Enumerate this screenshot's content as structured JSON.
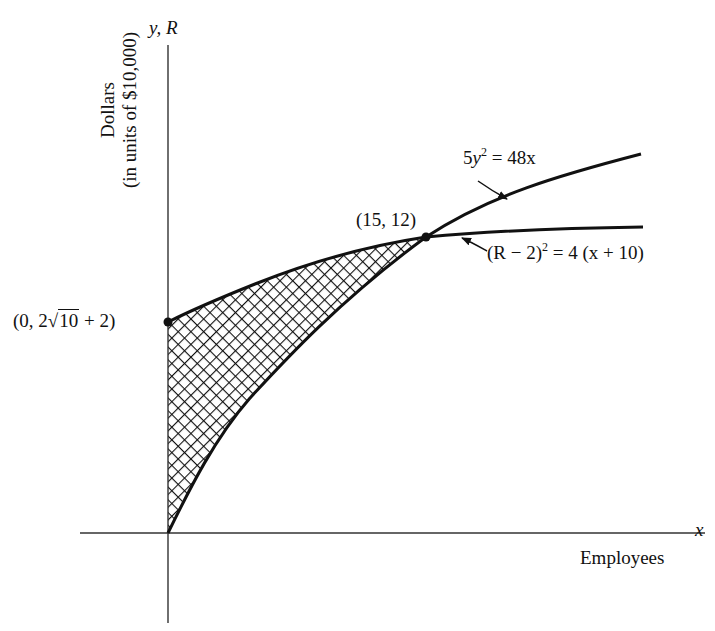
{
  "diagram": {
    "axes": {
      "x_axis_label": "x",
      "y_axis_label": "y, R",
      "x_axis_title": "Employees",
      "y_axis_title_line1": "Dollars",
      "y_axis_title_line2": "(in units of $10,000)"
    },
    "curves": [
      {
        "name": "cost-curve",
        "equation_lhs_coef": "5",
        "equation_lhs_var": "y",
        "equation_lhs_exp": "2",
        "equation_rhs": "= 48x",
        "full_label": "5y^2 = 48x"
      },
      {
        "name": "revenue-curve",
        "equation_lhs": "(R − 2)",
        "equation_lhs_exp": "2",
        "equation_rhs": "= 4 (x + 10)",
        "full_label": "(R - 2)^2 = 4 (x + 10)"
      }
    ],
    "points": [
      {
        "label": "(15, 12)",
        "x": 15,
        "y": 12
      },
      {
        "label_prefix": "(0, 2",
        "label_radicand": "10",
        "label_suffix": " + 2)",
        "full_label": "(0, 2√10 + 2)",
        "x": 0,
        "y": "2√10 + 2"
      }
    ],
    "shaded_region": "area between (R-2)^2 = 4(x+10) above and 5y^2 = 48x below, from x = 0 to x = 15",
    "colors": {
      "ink": "#111111",
      "background": "#ffffff"
    }
  }
}
